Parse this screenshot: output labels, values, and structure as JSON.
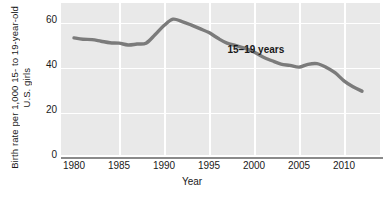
{
  "chart_data": {
    "type": "line",
    "title": "",
    "subtitle": "",
    "xlabel": "Year",
    "ylabel": "Birth rate per 1,000 15- to 19-year-old U.S. girls",
    "ylabel_lines": [
      "Birth rate per 1,000 15- to 19-year-old",
      "U.S. girls"
    ],
    "xlim": [
      1979,
      1984
    ],
    "xlim_actual": [
      1979,
      2013
    ],
    "ylim": [
      0,
      68
    ],
    "yticks": [
      0,
      20,
      40,
      60
    ],
    "ytick_labels": [
      "0",
      "20",
      "40",
      "60"
    ],
    "xticks": [
      1980,
      1985,
      1990,
      1995,
      2000,
      2005,
      2010
    ],
    "xtick_labels": [
      "1980",
      "1985",
      "1990",
      "1995",
      "2000",
      "2005",
      "2010"
    ],
    "grid": true,
    "grid_color": "#ffffff",
    "plot_background": "#e9e9e9",
    "legend_position": "inline-annotation",
    "annotations": [
      {
        "text": "15–19 years",
        "x": 2001.5,
        "y": 47.5
      }
    ],
    "series": [
      {
        "name": "15–19 years",
        "color": "#7b7b7b",
        "line_width": 3.4,
        "x": [
          1980,
          1981,
          1982,
          1983,
          1984,
          1985,
          1986,
          1987,
          1988,
          1989,
          1990,
          1991,
          1992,
          1993,
          1994,
          1995,
          1996,
          1997,
          1998,
          1999,
          2000,
          2001,
          2002,
          2003,
          2004,
          2005,
          2006,
          2007,
          2008,
          2009,
          2010,
          2011,
          2012
        ],
        "values": [
          53.0,
          52.4,
          52.2,
          51.5,
          50.8,
          50.6,
          49.8,
          50.2,
          50.6,
          54.4,
          58.6,
          61.5,
          60.4,
          58.9,
          57.2,
          55.4,
          52.8,
          50.6,
          49.5,
          48.2,
          46.6,
          44.3,
          42.6,
          41.1,
          40.5,
          39.7,
          41.0,
          41.3,
          39.7,
          37.2,
          33.5,
          30.8,
          28.8
        ]
      }
    ]
  }
}
